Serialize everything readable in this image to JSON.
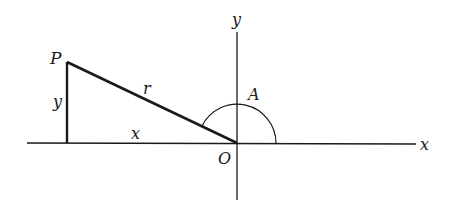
{
  "diagram": {
    "type": "trigonometry-angle-diagram",
    "labels": {
      "point": "P",
      "hypotenuse": "r",
      "opposite": "y",
      "adjacent": "x",
      "angle": "A",
      "origin": "O",
      "x_axis": "x",
      "y_axis": "y"
    },
    "colors": {
      "stroke": "#1a1a1a",
      "background": "#ffffff"
    },
    "geometry": {
      "origin": [
        237,
        143
      ],
      "point_P": [
        67,
        62
      ],
      "foot_of_perpendicular": [
        67,
        143
      ],
      "angle_arc_radius": 39
    }
  }
}
